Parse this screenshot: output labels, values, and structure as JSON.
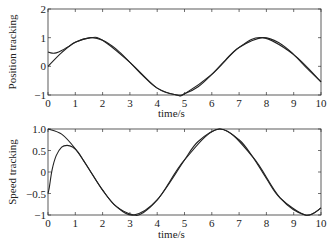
{
  "chart_data": [
    {
      "type": "line",
      "title": "",
      "xlabel": "time/s",
      "ylabel": "Position tracking",
      "xlim": [
        0,
        10
      ],
      "ylim": [
        -1,
        2
      ],
      "xticks": [
        0,
        1,
        2,
        3,
        4,
        5,
        6,
        7,
        8,
        9,
        10
      ],
      "yticks": [
        -1,
        0,
        1,
        2
      ],
      "ytick_labels": [
        "−1",
        "0",
        "1",
        "2"
      ],
      "grid": false,
      "legend": null,
      "series": [
        {
          "name": "reference",
          "description": "sin(t)",
          "x": [
            0,
            0.5,
            1.0,
            1.5708,
            2.0,
            2.5,
            3.0,
            3.5,
            4.0,
            4.7124,
            5.0,
            5.5,
            6.0,
            6.5,
            7.0,
            7.854,
            8.5,
            9.0,
            9.5,
            10.0
          ],
          "values": [
            0,
            0.48,
            0.84,
            1.0,
            0.91,
            0.6,
            0.14,
            -0.35,
            -0.76,
            -1.0,
            -0.96,
            -0.71,
            -0.28,
            0.22,
            0.66,
            1.0,
            0.8,
            0.41,
            -0.08,
            -0.54
          ]
        },
        {
          "name": "actual",
          "description": "tracked output, starts at 0.5 and converges by t≈0.8",
          "x": [
            0,
            0.15,
            0.3,
            0.5,
            0.8,
            1.0,
            1.5708,
            2.0,
            3.0,
            4.0,
            4.7124,
            5.0,
            6.0,
            7.0,
            7.854,
            9.0,
            10.0
          ],
          "values": [
            0.5,
            0.46,
            0.47,
            0.55,
            0.72,
            0.84,
            1.0,
            0.91,
            0.14,
            -0.76,
            -1.0,
            -0.96,
            -0.28,
            0.66,
            1.0,
            0.41,
            -0.54
          ]
        }
      ]
    },
    {
      "type": "line",
      "title": "",
      "xlabel": "time/s",
      "ylabel": "Speed tracking",
      "xlim": [
        0,
        10
      ],
      "ylim": [
        -1,
        1
      ],
      "xticks": [
        0,
        1,
        2,
        3,
        4,
        5,
        6,
        7,
        8,
        9,
        10
      ],
      "yticks": [
        -1,
        -0.5,
        0,
        0.5,
        1.0
      ],
      "ytick_labels": [
        "−1",
        "−0.5",
        "0",
        "0.5",
        "1.0"
      ],
      "grid": false,
      "legend": null,
      "series": [
        {
          "name": "reference",
          "description": "cos(t)",
          "x": [
            0,
            0.5,
            1.0,
            1.5,
            2.0,
            2.5,
            3.1416,
            3.5,
            4.0,
            4.5,
            5.0,
            5.5,
            6.2832,
            7.0,
            7.5,
            8.0,
            8.5,
            9.4248,
            10.0
          ],
          "values": [
            1.0,
            0.88,
            0.54,
            0.07,
            -0.42,
            -0.8,
            -1.0,
            -0.94,
            -0.65,
            -0.21,
            0.28,
            0.71,
            1.0,
            0.75,
            0.35,
            -0.15,
            -0.6,
            -1.0,
            -0.84
          ]
        },
        {
          "name": "actual",
          "description": "tracked output, starts near -0.5, peaks ~0.62 at t≈0.7, converges by t≈1.3",
          "x": [
            0,
            0.05,
            0.15,
            0.3,
            0.5,
            0.7,
            0.9,
            1.1,
            1.3,
            1.5,
            2.0,
            2.5,
            3.1416,
            4.0,
            5.0,
            6.2832,
            7.5,
            8.5,
            9.4248,
            10.0
          ],
          "values": [
            -0.5,
            -0.35,
            0.05,
            0.38,
            0.58,
            0.62,
            0.58,
            0.46,
            0.27,
            0.07,
            -0.42,
            -0.8,
            -1.0,
            -0.65,
            0.28,
            1.0,
            0.35,
            -0.6,
            -1.0,
            -0.84
          ]
        }
      ]
    }
  ],
  "plots": [
    {
      "ylabel": "Position tracking",
      "xlabel": "time/s"
    },
    {
      "ylabel": "Speed tracking",
      "xlabel": "time/s"
    }
  ]
}
